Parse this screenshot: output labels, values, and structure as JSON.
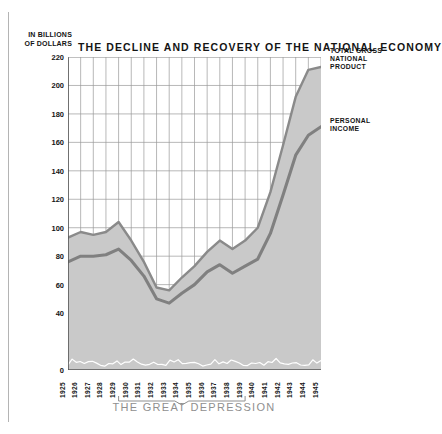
{
  "header": {
    "units_line1": "IN BILLIONS",
    "units_line2": "OF DOLLARS",
    "title": "THE DECLINE AND RECOVERY OF THE NATIONAL ECONOMY"
  },
  "legend": {
    "gnp": [
      "TOTAL GROSS",
      "NATIONAL",
      "PRODUCT"
    ],
    "personal_income": [
      "PERSONAL",
      "INCOME"
    ]
  },
  "annotation": {
    "depression_label": "THE GREAT DEPRESSION",
    "depression_span": [
      "1929",
      "1939"
    ]
  },
  "colors": {
    "area_fill": "#c9c9c9",
    "gnp_line": "#8a8a8a",
    "personal_income_line": "#808080",
    "grid": "#9a9a9a",
    "axis": "#555555",
    "baseline_zigzag": "#ffffff",
    "caption": "#8f8f8f",
    "text": "#141414"
  },
  "chart_data": {
    "type": "area",
    "title": "THE DECLINE AND RECOVERY OF THE NATIONAL ECONOMY",
    "xlabel": "",
    "ylabel": "IN BILLIONS OF DOLLARS",
    "ylim": [
      0,
      220
    ],
    "yticks": [
      0,
      40,
      60,
      80,
      100,
      120,
      140,
      160,
      180,
      200,
      220
    ],
    "ytick_labels": [
      "0",
      "40",
      "60",
      "80",
      "100",
      "120",
      "140",
      "160",
      "180",
      "200",
      "220"
    ],
    "grid": true,
    "legend_position": "right",
    "categories": [
      "1925",
      "1926",
      "1927",
      "1928",
      "1929",
      "1930",
      "1931",
      "1932",
      "1933",
      "1934",
      "1935",
      "1936",
      "1937",
      "1938",
      "1939",
      "1940",
      "1941",
      "1942",
      "1943",
      "1944",
      "1945"
    ],
    "series": [
      {
        "name": "TOTAL GROSS NATIONAL PRODUCT",
        "values": [
          93,
          97,
          95,
          97,
          104,
          91,
          76,
          58,
          56,
          65,
          73,
          83,
          91,
          85,
          91,
          100,
          125,
          158,
          192,
          211,
          213
        ]
      },
      {
        "name": "PERSONAL INCOME",
        "values": [
          76,
          80,
          80,
          81,
          85,
          77,
          66,
          50,
          47,
          54,
          60,
          69,
          74,
          68,
          73,
          78,
          96,
          123,
          151,
          165,
          171
        ]
      }
    ],
    "baseline_series": {
      "name": "baseline-zigzag",
      "note": "decorative white zigzag drawn along the zero baseline"
    }
  }
}
